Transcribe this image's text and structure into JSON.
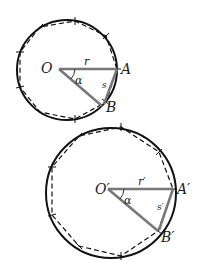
{
  "diagrams": [
    {
      "name": "small-circle",
      "center_label": "O",
      "point_a_label": "A",
      "point_b_label": "B",
      "radius_label": "r",
      "arc_label": "s",
      "angle_label": "α"
    },
    {
      "name": "large-circle",
      "center_label": "O′",
      "point_a_label": "A′",
      "point_b_label": "B′",
      "radius_label": "r′",
      "arc_label": "s′",
      "angle_label": "α"
    }
  ],
  "colors": {
    "circle": "#111111",
    "radius": "#777777",
    "dashed_polygon": "#111111"
  }
}
